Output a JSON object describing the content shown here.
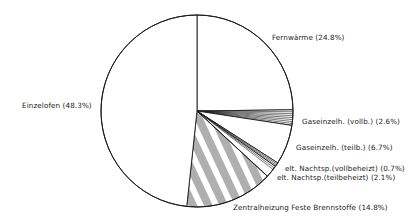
{
  "chart_data": {
    "type": "pie",
    "title": "",
    "start_angle_deg": -90,
    "direction": "clockwise",
    "center": [
      197,
      111
    ],
    "radius": 96,
    "slices": [
      {
        "name": "Fernwärme",
        "value": 24.8,
        "label": "Fernwärme (24.8%)",
        "fill": "none",
        "label_pos": [
          272,
          34
        ]
      },
      {
        "name": "Gaseinzelh. (vollb.)",
        "value": 2.6,
        "label": "Gaseinzelh. (vollb.) (2.6%)",
        "fill": "radial",
        "label_pos": [
          302,
          118
        ]
      },
      {
        "name": "Gaseinzelh. (teilb.)",
        "value": 6.7,
        "label": "Gaseinzelh. (teilb.) (6.7%)",
        "fill": "none",
        "label_pos": [
          296,
          144
        ]
      },
      {
        "name": "elt. Nachtsp. (vollbeheizt)",
        "value": 0.7,
        "label": "elt. Nachtsp.(vollbeheizt) (0.7%)",
        "fill": "radial",
        "label_pos": [
          285,
          165
        ]
      },
      {
        "name": "elt. Nachtsp. (teilbeheizt)",
        "value": 2.1,
        "label": "elt. Nachtsp.(teilbeheizt) (2.1%)",
        "fill": "edge",
        "label_pos": [
          277,
          174
        ]
      },
      {
        "name": "Zentralheizung Feste Brennstoffe",
        "value": 14.8,
        "label": "Zentralheizung Feste Brennstoffe (14.8%)",
        "fill": "hatch",
        "label_pos": [
          233,
          204
        ]
      },
      {
        "name": "Einzelofen",
        "value": 48.3,
        "label": "Einzelofen (48.3%)",
        "fill": "none",
        "label_pos": [
          22,
          102
        ]
      }
    ],
    "legend": "none",
    "colors": {
      "stroke": "#1a1a1a",
      "background": "#ffffff"
    }
  }
}
